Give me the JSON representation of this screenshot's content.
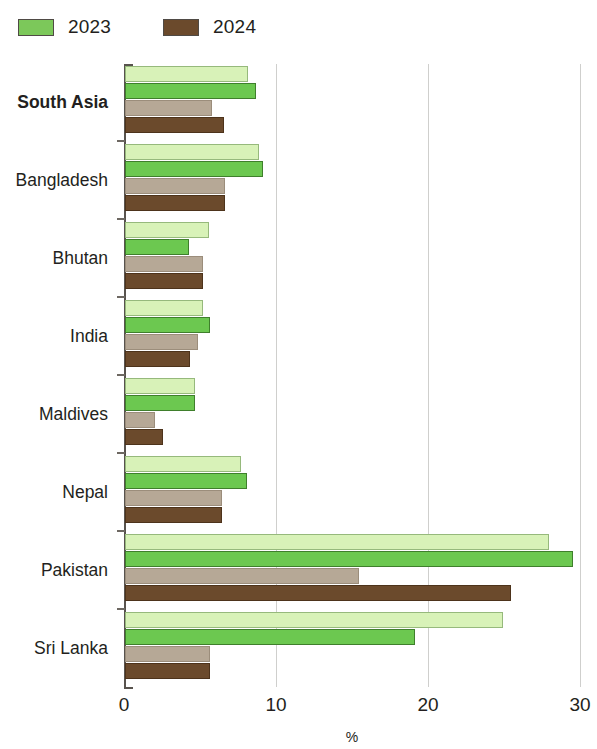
{
  "legend": {
    "entries": [
      {
        "label": "2023",
        "color": "#7cc85a",
        "icon": "legend-swatch-2023"
      },
      {
        "label": "2024",
        "color": "#6b4a2c",
        "icon": "legend-swatch-2024"
      }
    ]
  },
  "axis": {
    "x_title": "%",
    "ticks": [
      "0",
      "10",
      "20",
      "30"
    ]
  },
  "chart_data": {
    "type": "bar",
    "orientation": "horizontal",
    "title": "",
    "subtitle": "",
    "xlabel": "%",
    "ylabel": "",
    "xlim": [
      0,
      30
    ],
    "xticks": [
      0,
      10,
      20,
      30
    ],
    "grid": true,
    "legend_position": "top-left",
    "categories": [
      "South Asia",
      "Bangladesh",
      "Bhutan",
      "India",
      "Maldives",
      "Nepal",
      "Pakistan",
      "Sri Lanka"
    ],
    "series": [
      {
        "name": "2023",
        "variant": "light",
        "color": "#d8f2b8",
        "values": [
          8.1,
          8.8,
          5.5,
          5.1,
          4.6,
          7.6,
          27.9,
          24.9
        ]
      },
      {
        "name": "2023",
        "variant": "dark",
        "color": "#6cc850",
        "values": [
          8.6,
          9.1,
          4.2,
          5.6,
          4.6,
          8.0,
          29.5,
          19.1
        ]
      },
      {
        "name": "2024",
        "variant": "light",
        "color": "#b6a896",
        "values": [
          5.7,
          6.6,
          5.1,
          4.8,
          2.0,
          6.4,
          15.4,
          5.6
        ]
      },
      {
        "name": "2024",
        "variant": "dark",
        "color": "#6b4a2c",
        "values": [
          6.5,
          6.6,
          5.1,
          4.3,
          2.5,
          6.4,
          25.4,
          5.6
        ]
      }
    ]
  }
}
